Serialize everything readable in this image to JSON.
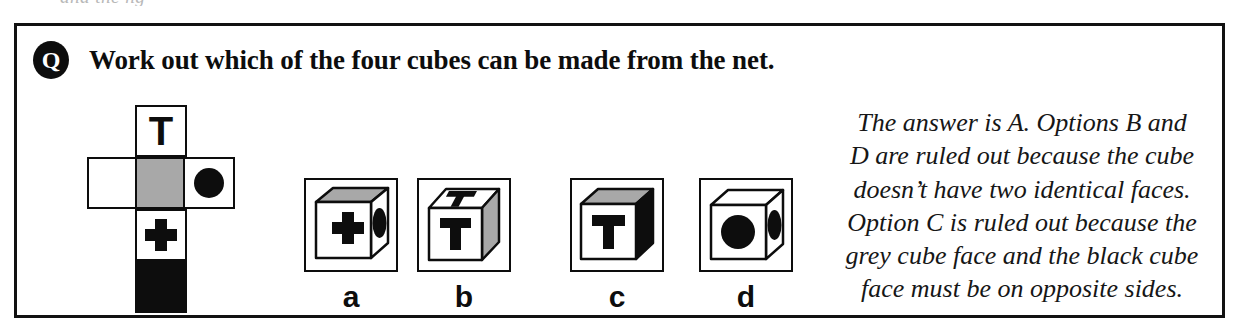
{
  "ghost_line_above": "and the ng",
  "question": {
    "badge": "Q",
    "badge_icon": "question-badge-icon",
    "text": "Work out which of the four cubes can be made from the net."
  },
  "net": {
    "name": "cube-net",
    "shape": "cross",
    "cells": [
      {
        "id": "top",
        "position": "row1-col2",
        "fill": "#ffffff",
        "mark": "T",
        "mark_color": "#0d0d0d"
      },
      {
        "id": "left",
        "position": "row2-col1",
        "fill": "#ffffff",
        "mark": "none",
        "mark_color": ""
      },
      {
        "id": "center",
        "position": "row2-col2",
        "fill": "#a8a8a8",
        "mark": "none",
        "mark_color": ""
      },
      {
        "id": "right",
        "position": "row2-col3",
        "fill": "#ffffff",
        "mark": "circle",
        "mark_color": "#0d0d0d"
      },
      {
        "id": "plus",
        "position": "row3-col2",
        "fill": "#ffffff",
        "mark": "plus",
        "mark_color": "#0d0d0d"
      },
      {
        "id": "black",
        "position": "row4-col2",
        "fill": "#0d0d0d",
        "mark": "none",
        "mark_color": ""
      }
    ]
  },
  "options": [
    {
      "key": "a",
      "label": "a",
      "faces": {
        "front": "plus on white",
        "top": "grey",
        "right": "ellipse on white"
      },
      "colors": {
        "front": "#ffffff",
        "top": "#a8a8a8",
        "right": "#ffffff",
        "mark": "#0d0d0d"
      }
    },
    {
      "key": "b",
      "label": "b",
      "faces": {
        "front": "T on white",
        "top": "T on white",
        "right": "grey"
      },
      "colors": {
        "front": "#ffffff",
        "top": "#ffffff",
        "right": "#a8a8a8",
        "mark": "#0d0d0d"
      }
    },
    {
      "key": "c",
      "label": "c",
      "faces": {
        "front": "T on white",
        "top": "grey",
        "right": "black"
      },
      "colors": {
        "front": "#ffffff",
        "top": "#a8a8a8",
        "right": "#0d0d0d",
        "mark": "#0d0d0d"
      }
    },
    {
      "key": "d",
      "label": "d",
      "faces": {
        "front": "circle on white",
        "top": "white",
        "right": "ellipse on white"
      },
      "colors": {
        "front": "#ffffff",
        "top": "#ffffff",
        "right": "#ffffff",
        "mark": "#0d0d0d"
      }
    }
  ],
  "explanation": {
    "lines": [
      "The answer is A.  Options B and",
      "D are ruled out because the cube",
      "doesn’t have two identical faces.",
      "Option C is ruled out because the",
      "grey cube face and the black cube",
      "face must be on opposite sides."
    ],
    "full_text": "The answer is A. Options B and D are ruled out because the cube doesn’t have two identical faces. Option C is ruled out because the grey cube face and the black cube face must be on opposite sides."
  },
  "colors": {
    "ink": "#0d0d0d",
    "grey_face": "#a8a8a8",
    "paper": "#ffffff"
  }
}
